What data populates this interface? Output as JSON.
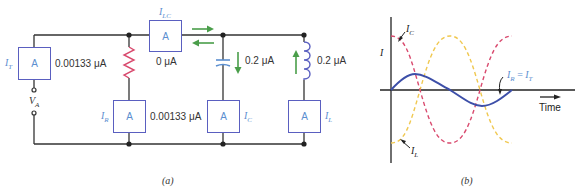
{
  "circuit": {
    "meters": {
      "total": {
        "symbol": "I",
        "sub": "T",
        "glyph": "A",
        "reading": "0.00133 μA"
      },
      "lc": {
        "symbol": "I",
        "sub": "LC",
        "glyph": "A",
        "reading": "0 μA"
      },
      "resistor": {
        "symbol": "I",
        "sub": "R",
        "glyph": "A",
        "reading": "0.00133 μA"
      },
      "capacitor": {
        "symbol": "I",
        "sub": "C",
        "glyph": "A"
      },
      "inductor": {
        "symbol": "I",
        "sub": "L",
        "glyph": "A"
      }
    },
    "capacitor_current": "0.2 μA",
    "inductor_current": "0.2 μA",
    "source": {
      "symbol": "V",
      "sub": "A"
    },
    "caption": "(a)"
  },
  "waveform": {
    "y_axis_label": "I",
    "x_axis_label": "Time",
    "curves": {
      "ic": {
        "symbol": "I",
        "sub": "C",
        "color": "#d94a6e",
        "style": "dashed"
      },
      "il": {
        "symbol": "I",
        "sub": "L",
        "color": "#f0c850",
        "style": "dashed"
      },
      "ir": {
        "symbol": "I",
        "sub": "R",
        "eq": " = ",
        "symbol2": "I",
        "sub2": "T",
        "color": "#3d4fa8",
        "style": "solid"
      }
    },
    "caption": "(b)"
  },
  "colors": {
    "wire": "#333333",
    "meter_border": "#5a5fc0",
    "label_blue": "#5b8fd0",
    "resistor": "#d94a6e",
    "capacitor": "#5b8fd0",
    "inductor": "#5a5fc0",
    "arrow": "#4a9e4a"
  }
}
